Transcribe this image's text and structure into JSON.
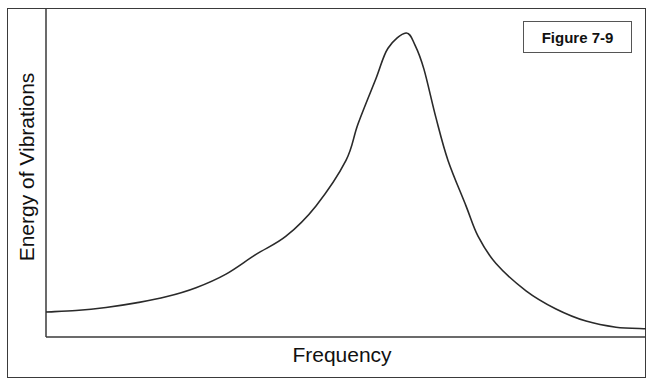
{
  "figure": {
    "label": "Figure 7-9"
  },
  "axes": {
    "xlabel": "Frequency",
    "ylabel": "Energy of Vibrations"
  },
  "colors": {
    "line": "#2a2a2a",
    "axis": "#3a3a3a",
    "background": "#ffffff"
  },
  "chart_data": {
    "type": "line",
    "title": "Figure 7-9",
    "xlabel": "Frequency",
    "ylabel": "Energy of Vibrations",
    "x_ticks": [],
    "y_ticks": [],
    "grid": false,
    "legend": null,
    "x": [
      0,
      5,
      10,
      15,
      20,
      25,
      30,
      35,
      40,
      45,
      50,
      52,
      55,
      57,
      60,
      61.5,
      63,
      65,
      67,
      70,
      72,
      75,
      80,
      85,
      90,
      95,
      100
    ],
    "values": [
      8,
      8.5,
      9.5,
      11,
      13,
      16,
      20.5,
      27,
      33,
      43,
      58,
      70,
      85,
      95,
      100,
      96,
      88,
      72,
      58,
      43,
      33,
      24,
      15,
      9,
      5,
      3,
      2.5
    ],
    "xlim": [
      0,
      100
    ],
    "ylim": [
      0,
      100
    ],
    "peak": {
      "x": 60,
      "y": 100
    }
  }
}
